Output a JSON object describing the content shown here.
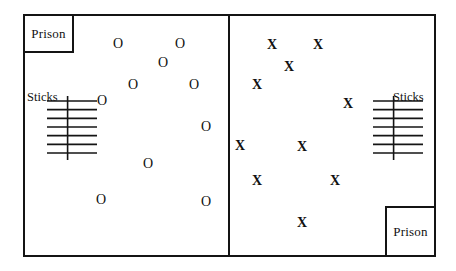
{
  "diagram": {
    "stroke_color": "#141414",
    "background_color": "#ffffff",
    "field": {
      "x": 23,
      "y": 14,
      "width": 413,
      "height": 243
    },
    "center_line": {
      "x": 228,
      "y": 14,
      "height": 243
    },
    "prisons": [
      {
        "id": "prison-left",
        "label": "Prison",
        "x": 23,
        "y": 14,
        "width": 51,
        "height": 39
      },
      {
        "id": "prison-right",
        "label": "Prison",
        "x": 385,
        "y": 206,
        "width": 51,
        "height": 51
      }
    ],
    "sticks": [
      {
        "id": "sticks-left",
        "label": "Sticks",
        "label_x": 27,
        "label_y": 90,
        "bundle_x": 46,
        "bundle_y": 96,
        "bundle_width": 54,
        "bundle_height": 64,
        "rung_count": 7
      },
      {
        "id": "sticks-right",
        "label": "Sticks",
        "label_x": 393,
        "label_y": 90,
        "bundle_x": 372,
        "bundle_y": 96,
        "bundle_width": 54,
        "bundle_height": 64,
        "rung_count": 7
      }
    ],
    "teams": [
      {
        "id": "team-o",
        "symbol": "O",
        "side": "left",
        "count": 11,
        "players": [
          {
            "x": 118,
            "y": 44
          },
          {
            "x": 180,
            "y": 44
          },
          {
            "x": 163,
            "y": 63
          },
          {
            "x": 133,
            "y": 85
          },
          {
            "x": 194,
            "y": 85
          },
          {
            "x": 102,
            "y": 101
          },
          {
            "x": 206,
            "y": 127
          },
          {
            "x": 148,
            "y": 164
          },
          {
            "x": 101,
            "y": 200
          },
          {
            "x": 206,
            "y": 202
          }
        ]
      },
      {
        "id": "team-x",
        "symbol": "X",
        "side": "right",
        "count": 10,
        "players": [
          {
            "x": 272,
            "y": 45
          },
          {
            "x": 318,
            "y": 45
          },
          {
            "x": 289,
            "y": 67
          },
          {
            "x": 257,
            "y": 85
          },
          {
            "x": 348,
            "y": 104
          },
          {
            "x": 240,
            "y": 146
          },
          {
            "x": 302,
            "y": 147
          },
          {
            "x": 257,
            "y": 181
          },
          {
            "x": 335,
            "y": 181
          },
          {
            "x": 302,
            "y": 223
          }
        ]
      }
    ]
  }
}
